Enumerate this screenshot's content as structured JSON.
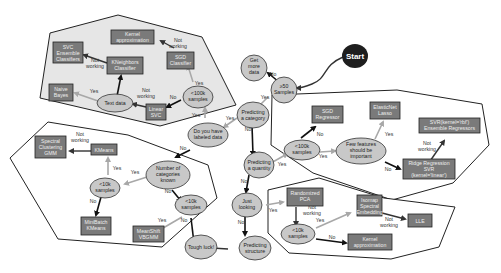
{
  "diagram": {
    "start": "Start",
    "decisions": {
      "gt50": [
        "≥50",
        "Samples"
      ],
      "get_more_data": [
        "Get",
        "more",
        "data"
      ],
      "predicting_category": [
        "Predicting",
        "a category"
      ],
      "predicting_quantity": [
        "Predicting",
        "a quantity"
      ],
      "just_looking": [
        "Just",
        "looking"
      ],
      "predicting_structure": [
        "Predicting",
        "structure"
      ],
      "tough_luck": [
        "Tough luck!"
      ],
      "labeled_data": [
        "Do you have",
        "labeled data"
      ],
      "cls_lt100k": [
        "<100k",
        "samples"
      ],
      "text_data": [
        "Text data"
      ],
      "num_categories": [
        "Number of",
        "categories",
        "known"
      ],
      "clu_lt10k_a": [
        "<10k",
        "samples"
      ],
      "clu_lt10k_b": [
        "<10k",
        "samples"
      ],
      "reg_lt100k": [
        "<100k",
        "samples"
      ],
      "few_features": [
        "Few features",
        "should be",
        "important"
      ],
      "dim_lt10k": [
        "<10k",
        "samples"
      ]
    },
    "estimators": {
      "kernel_approx_cls": [
        "Kernel",
        "approximation"
      ],
      "sgd_classifier": [
        "SGD",
        "Classifier"
      ],
      "svc_ensemble": [
        "SVC",
        "Ensemble",
        "Classifiers"
      ],
      "kneighbors": [
        "KNeighbors",
        "Classifier"
      ],
      "naive_bayes": [
        "Naive",
        "Bayes"
      ],
      "linear_svc": [
        "Linear",
        "SVC"
      ],
      "spectral_gmm": [
        "Spectral",
        "Clustering",
        "GMM"
      ],
      "kmeans": [
        "KMeans"
      ],
      "minibatch_kmeans": [
        "MiniBatch",
        "KMeans"
      ],
      "meanshift_vbgmm": [
        "MeanShift",
        "VBGMM"
      ],
      "sgd_regressor": [
        "SGD",
        "Regressor"
      ],
      "elasticnet_lasso": [
        "ElasticNet",
        "Lasso"
      ],
      "svr_rbf_ensemble": [
        "SVR(kernel='rbf')",
        "Ensemble Regressors"
      ],
      "ridge_svr_linear": [
        "Ridge Regression",
        "SVR",
        "(kernel='linear')"
      ],
      "randomized_pca": [
        "Randomized",
        "PCA"
      ],
      "isomap_spectral": [
        "Isomap",
        "Spectral",
        "Embedding"
      ],
      "lle": [
        "LLE"
      ],
      "kernel_approx_dim": [
        "Kernel",
        "approximation"
      ]
    },
    "edge_labels": {
      "yes": "Yes",
      "no": "No",
      "not_working": [
        "Not",
        "working"
      ]
    },
    "colors": {
      "decision_fill": "#c8c8c8",
      "estimator_fill": "#7a7a7a",
      "start_fill": "#1e1e1e",
      "yes_arrow": "#a8a8a8",
      "no_arrow": "#111111",
      "classification_region": "#e6e6e6"
    }
  }
}
